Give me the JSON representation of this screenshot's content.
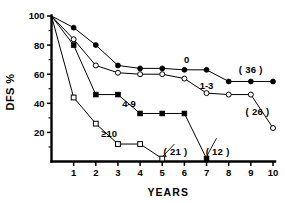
{
  "chart_data": {
    "type": "line",
    "title": "",
    "xlabel": "YEARS",
    "ylabel": "DFS  %",
    "xlim": [
      0,
      10
    ],
    "ylim": [
      0,
      100
    ],
    "xticks": [
      "1",
      "2",
      "3",
      "4",
      "5",
      "6",
      "7",
      "8",
      "9",
      "10"
    ],
    "yticks": [
      "20",
      "40",
      "60",
      "80",
      "100"
    ],
    "y_minor_ticks": [
      10,
      30,
      50,
      70,
      90
    ],
    "grid": false,
    "legend_position": "inline-annotations",
    "series": [
      {
        "name": "0",
        "label": "0",
        "marker": "filled-circle",
        "x": [
          0,
          1,
          2,
          3,
          4,
          5,
          6,
          7,
          8,
          9,
          10
        ],
        "values": [
          100,
          92,
          80,
          66,
          64,
          64,
          63,
          63,
          55,
          55,
          55
        ],
        "end_annotation": "( 36 )"
      },
      {
        "name": "1-3",
        "label": "1-3",
        "marker": "open-circle",
        "x": [
          0,
          1,
          2,
          3,
          4,
          5,
          6,
          7,
          8,
          9,
          10
        ],
        "values": [
          100,
          84,
          66,
          61,
          60,
          60,
          57,
          47,
          46,
          46,
          23
        ],
        "end_annotation": "( 26 )"
      },
      {
        "name": "4-9",
        "label": "4-9",
        "marker": "filled-square",
        "x": [
          0,
          1,
          2,
          3,
          4,
          5,
          6,
          7
        ],
        "values": [
          100,
          80,
          46,
          46,
          33,
          33,
          33,
          2
        ],
        "end_annotation": "( 12 )"
      },
      {
        "name": "≥10",
        "label": "≥10",
        "marker": "open-square",
        "x": [
          0,
          1,
          2,
          3,
          4,
          5
        ],
        "values": [
          100,
          44,
          26,
          12,
          12,
          2
        ],
        "end_annotation": "( 21 )"
      }
    ],
    "annotations": [
      {
        "text": "0",
        "x": 6.1,
        "y": 70
      },
      {
        "text": "1-3",
        "x": 7.0,
        "y": 52
      },
      {
        "text": "4-9",
        "x": 3.5,
        "y": 40
      },
      {
        "text": "≥10",
        "x": 2.6,
        "y": 19
      },
      {
        "text": "( 36 )",
        "x": 9.0,
        "y": 63
      },
      {
        "text": "( 26 )",
        "x": 9.3,
        "y": 34
      },
      {
        "text": "( 21 )",
        "x": 5.6,
        "y": 7
      },
      {
        "text": "( 12 )",
        "x": 7.5,
        "y": 7
      }
    ]
  },
  "colors": {
    "ink": "#000000",
    "background": "#ffffff"
  }
}
